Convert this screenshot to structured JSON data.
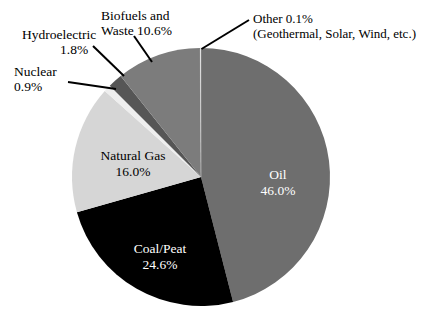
{
  "chart_data": {
    "type": "pie",
    "title": "",
    "subtitle": "",
    "xlabel": "",
    "ylabel": "",
    "legend_position": "none",
    "grid": false,
    "total": 100.0,
    "units": "percent",
    "start_angle_deg": 0,
    "direction": "clockwise",
    "categories": [
      "Oil",
      "Coal/Peat",
      "Natural Gas",
      "Nuclear",
      "Hydroelectric",
      "Biofuels and Waste",
      "Other"
    ],
    "values": [
      46.0,
      24.6,
      16.0,
      0.9,
      1.8,
      10.6,
      0.1
    ],
    "slices": [
      {
        "name": "Oil",
        "label_line1": "Oil",
        "label_line2": "46.0%",
        "value": 46.0,
        "value_text": "46.0%",
        "color": "#6e6e6e",
        "text_color": "#ffffff",
        "label_placement": "inside"
      },
      {
        "name": "Coal/Peat",
        "label_line1": "Coal/Peat",
        "label_line2": "24.6%",
        "value": 24.6,
        "value_text": "24.6%",
        "color": "#000000",
        "text_color": "#ffffff",
        "label_placement": "inside"
      },
      {
        "name": "Natural Gas",
        "label_line1": "Natural Gas",
        "label_line2": "16.0%",
        "value": 16.0,
        "value_text": "16.0%",
        "color": "#d6d6d6",
        "text_color": "#000000",
        "label_placement": "inside"
      },
      {
        "name": "Nuclear",
        "label_line1": "Nuclear",
        "label_line2": "0.9%",
        "value": 0.9,
        "value_text": "0.9%",
        "color": "#eeeeee",
        "text_color": "#000000",
        "label_placement": "callout"
      },
      {
        "name": "Hydroelectric",
        "label_line1": "Hydroelectric",
        "label_line2": "1.8%",
        "value": 1.8,
        "value_text": "1.8%",
        "color": "#565656",
        "text_color": "#000000",
        "label_placement": "callout"
      },
      {
        "name": "Biofuels and Waste",
        "label_line1": "Biofuels and",
        "label_line2": "Waste 10.6%",
        "value": 10.6,
        "value_text": "10.6%",
        "color": "#7c7c7c",
        "text_color": "#000000",
        "label_placement": "callout"
      },
      {
        "name": "Other",
        "label_line1": "Other 0.1%",
        "label_line2": "(Geothermal, Solar, Wind, etc.)",
        "value": 0.1,
        "value_text": "0.1%",
        "color": "#ffffff",
        "text_color": "#000000",
        "label_placement": "callout"
      }
    ],
    "colors": {
      "oil": "#6e6e6e",
      "coal_peat": "#000000",
      "natural_gas": "#d6d6d6",
      "nuclear": "#eeeeee",
      "hydroelectric": "#565656",
      "biofuels_and_waste": "#7c7c7c",
      "background": "#ffffff",
      "leader_line": "#000000"
    }
  }
}
